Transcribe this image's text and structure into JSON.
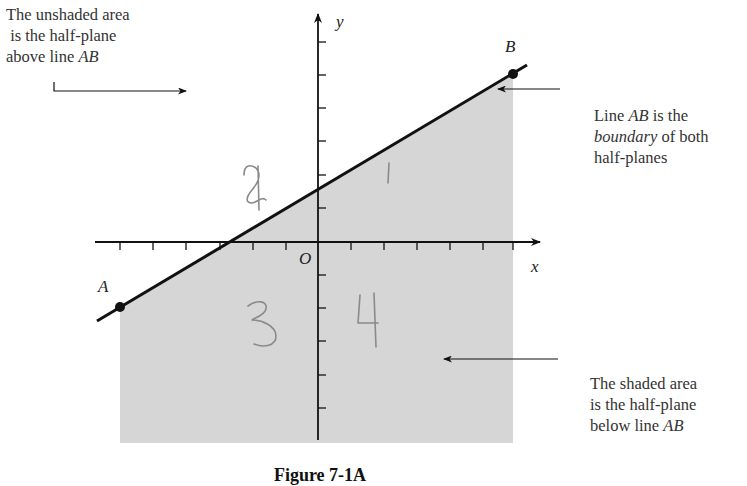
{
  "figure": {
    "caption": "Figure 7-1A"
  },
  "annotations": {
    "top_left": {
      "lines": [
        "The unshaded area",
        "is the half-plane",
        "above line "
      ],
      "italic_suffix": "AB"
    },
    "right_mid": {
      "line1_prefix": "Line ",
      "line1_italic": "AB",
      "line1_suffix": " is the",
      "line2_italic": "boundary",
      "line2_suffix": " of both",
      "line3": "half-planes"
    },
    "bottom_right": {
      "lines": [
        "The shaded area",
        "is the half-plane",
        "below line "
      ],
      "italic_suffix": "AB"
    }
  },
  "axes": {
    "x_label": "x",
    "y_label": "y",
    "origin_label": "O",
    "x_ticks": [
      -6,
      -5,
      -4,
      -3,
      -2,
      -1,
      1,
      2,
      3,
      4,
      5,
      6
    ],
    "y_ticks": [
      -6,
      -5,
      -4,
      -3,
      -2,
      -1,
      1,
      2,
      3,
      4,
      5,
      6
    ]
  },
  "points": {
    "A": {
      "label": "A",
      "x": -6,
      "y": -2
    },
    "B": {
      "label": "B",
      "x": 6,
      "y": 5
    }
  },
  "boundary_line": {
    "from": "A",
    "to": "B",
    "label": "AB"
  },
  "regions": {
    "shaded": "below line AB",
    "unshaded": "above line AB"
  },
  "handwritten_marks": [
    "1",
    "2",
    "3",
    "4"
  ],
  "colors": {
    "shaded_fill": "#d6d6d6",
    "line": "#111111",
    "text": "#333333",
    "handwriting": "#8a8a8a"
  }
}
